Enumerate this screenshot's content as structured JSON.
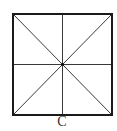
{
  "figure": {
    "label": "C",
    "shape": "square",
    "colors": {
      "stroke": "#1a1a1a",
      "inner_stroke": "#3a3a3a",
      "background": "#ffffff"
    },
    "square": {
      "x1": 13,
      "y1": 14,
      "x2": 112,
      "y2": 115
    },
    "center": {
      "x": 62.5,
      "y": 64.5
    }
  }
}
